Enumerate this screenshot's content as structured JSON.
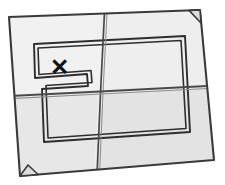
{
  "illustration": {
    "title": "Folded treasure map",
    "subject": "folded-paper-map",
    "marker_label": "✕",
    "marker_meaning": "x-marks-the-spot",
    "background_color": "#ffffff",
    "paper_fill": "#ececec",
    "paper_fill_shaded": "#e2e2e2",
    "paper_fill_light": "#f2f2f2",
    "outline_color": "#3a3a3a",
    "crease_color": "#4a4a4a",
    "border_color": "#2e2e2e",
    "marker_color": "#111111",
    "panels": [
      {
        "name": "top-left-panel",
        "shading": "light"
      },
      {
        "name": "top-right-panel",
        "shading": "light"
      },
      {
        "name": "bottom-left-panel",
        "shading": "shaded"
      },
      {
        "name": "bottom-right-panel",
        "shading": "shaded"
      }
    ],
    "creases": [
      {
        "name": "vertical-crease",
        "orientation": "vertical"
      },
      {
        "name": "horizontal-crease",
        "orientation": "horizontal"
      }
    ],
    "folded_corners": [
      {
        "name": "top-right-folded-corner"
      },
      {
        "name": "bottom-left-folded-corner"
      }
    ],
    "inner_border": {
      "name": "inner-double-border",
      "style": "double-line-rectangle-with-notch"
    }
  }
}
